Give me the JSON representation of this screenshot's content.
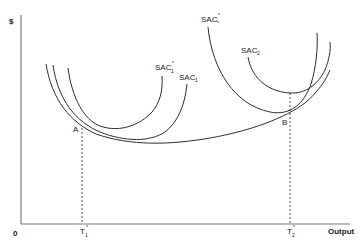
{
  "diagram": {
    "y_axis_label": "$",
    "x_axis_label": "Output",
    "origin_label": "0",
    "points": {
      "A": "A",
      "B": "B"
    },
    "ticks": {
      "t1": {
        "base": "T",
        "sub": "1",
        "sup": "*"
      },
      "t2": {
        "base": "T",
        "sub": "2",
        "sup": "*"
      }
    },
    "curves": {
      "sac1_star": {
        "base": "SAC",
        "sub": "1",
        "sup": "*"
      },
      "sac1": {
        "base": "SAC",
        "sub": "1",
        "sup": ""
      },
      "sac2_star": {
        "base": "SAC",
        "sub": "2",
        "sup": "*"
      },
      "sac2": {
        "base": "SAC",
        "sub": "2",
        "sup": ""
      }
    }
  }
}
